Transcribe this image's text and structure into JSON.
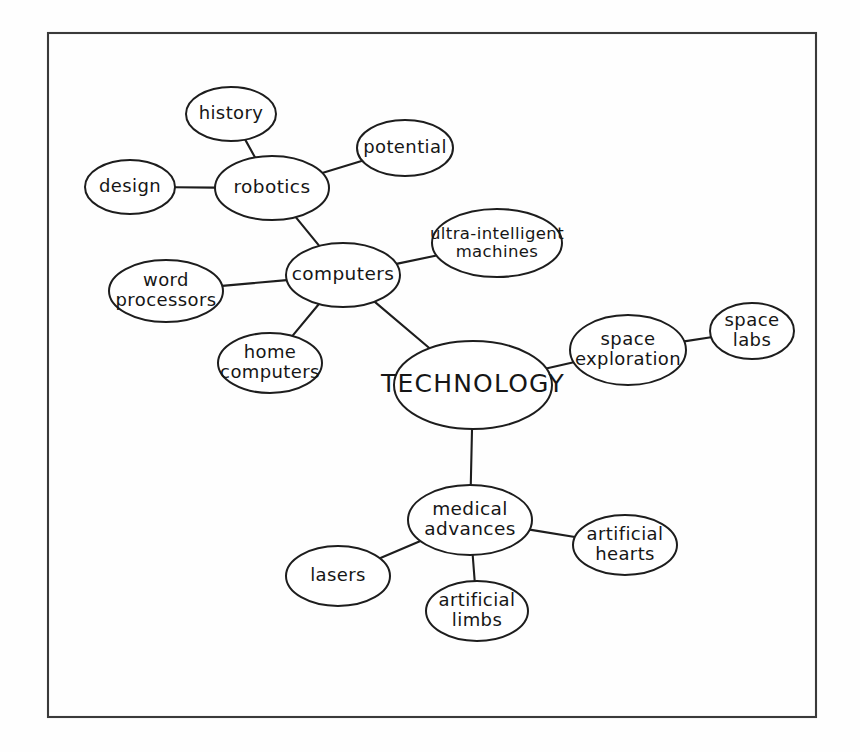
{
  "diagram": {
    "title": "TECHNOLOGY",
    "kind": "mind-map",
    "background_color": "#fefefe",
    "ink_color": "#1d1d1d",
    "frame": {
      "x": 48,
      "y": 33,
      "width": 768,
      "height": 684,
      "stroke": "#3a3a3a"
    }
  },
  "nodes": [
    {
      "id": "technology",
      "label": "TECHNOLOGY",
      "lines": [
        "TECHNOLOGY"
      ],
      "cx": 473,
      "cy": 385,
      "rx": 79,
      "ry": 44,
      "size": "root",
      "level": 0
    },
    {
      "id": "computers",
      "label": "computers",
      "lines": [
        "computers"
      ],
      "cx": 343,
      "cy": 275,
      "rx": 57,
      "ry": 32,
      "size": "lg",
      "level": 1
    },
    {
      "id": "space-exploration",
      "label": "space exploration",
      "lines": [
        "space",
        "exploration"
      ],
      "cx": 628,
      "cy": 350,
      "rx": 58,
      "ry": 35,
      "size": "md",
      "level": 1
    },
    {
      "id": "medical-advances",
      "label": "medical advances",
      "lines": [
        "medical",
        "advances"
      ],
      "cx": 470,
      "cy": 520,
      "rx": 62,
      "ry": 35,
      "size": "lg",
      "level": 1
    },
    {
      "id": "robotics",
      "label": "robotics",
      "lines": [
        "robotics"
      ],
      "cx": 272,
      "cy": 188,
      "rx": 57,
      "ry": 32,
      "size": "lg",
      "level": 2
    },
    {
      "id": "ultra-intelligent-machines",
      "label": "ultra-intelligent machines",
      "lines": [
        "ultra-intelligent",
        "machines"
      ],
      "cx": 497,
      "cy": 243,
      "rx": 65,
      "ry": 34,
      "size": "sm",
      "level": 2
    },
    {
      "id": "word-processors",
      "label": "word processors",
      "lines": [
        "word",
        "processors"
      ],
      "cx": 166,
      "cy": 291,
      "rx": 57,
      "ry": 31,
      "size": "md",
      "level": 2
    },
    {
      "id": "home-computers",
      "label": "home computers",
      "lines": [
        "home",
        "computers"
      ],
      "cx": 270,
      "cy": 363,
      "rx": 52,
      "ry": 30,
      "size": "md",
      "level": 2
    },
    {
      "id": "history",
      "label": "history",
      "lines": [
        "history"
      ],
      "cx": 231,
      "cy": 114,
      "rx": 45,
      "ry": 27,
      "size": "md",
      "level": 3
    },
    {
      "id": "design",
      "label": "design",
      "lines": [
        "design"
      ],
      "cx": 130,
      "cy": 187,
      "rx": 45,
      "ry": 27,
      "size": "md",
      "level": 3
    },
    {
      "id": "potential",
      "label": "potential",
      "lines": [
        "potential"
      ],
      "cx": 405,
      "cy": 148,
      "rx": 48,
      "ry": 28,
      "size": "md",
      "level": 3
    },
    {
      "id": "space-labs",
      "label": "space labs",
      "lines": [
        "space",
        "labs"
      ],
      "cx": 752,
      "cy": 331,
      "rx": 42,
      "ry": 28,
      "size": "md",
      "level": 2
    },
    {
      "id": "lasers",
      "label": "lasers",
      "lines": [
        "lasers"
      ],
      "cx": 338,
      "cy": 576,
      "rx": 52,
      "ry": 30,
      "size": "md",
      "level": 2
    },
    {
      "id": "artificial-limbs",
      "label": "artificial limbs",
      "lines": [
        "artificial",
        "limbs"
      ],
      "cx": 477,
      "cy": 611,
      "rx": 51,
      "ry": 30,
      "size": "md",
      "level": 2
    },
    {
      "id": "artificial-hearts",
      "label": "artificial hearts",
      "lines": [
        "artificial",
        "hearts"
      ],
      "cx": 625,
      "cy": 545,
      "rx": 52,
      "ry": 30,
      "size": "md",
      "level": 2
    }
  ],
  "edges": [
    {
      "from": "technology",
      "to": "computers"
    },
    {
      "from": "technology",
      "to": "space-exploration"
    },
    {
      "from": "technology",
      "to": "medical-advances"
    },
    {
      "from": "computers",
      "to": "robotics"
    },
    {
      "from": "computers",
      "to": "ultra-intelligent-machines"
    },
    {
      "from": "computers",
      "to": "word-processors"
    },
    {
      "from": "computers",
      "to": "home-computers"
    },
    {
      "from": "robotics",
      "to": "history"
    },
    {
      "from": "robotics",
      "to": "design"
    },
    {
      "from": "robotics",
      "to": "potential"
    },
    {
      "from": "space-exploration",
      "to": "space-labs"
    },
    {
      "from": "medical-advances",
      "to": "lasers"
    },
    {
      "from": "medical-advances",
      "to": "artificial-limbs"
    },
    {
      "from": "medical-advances",
      "to": "artificial-hearts"
    }
  ]
}
